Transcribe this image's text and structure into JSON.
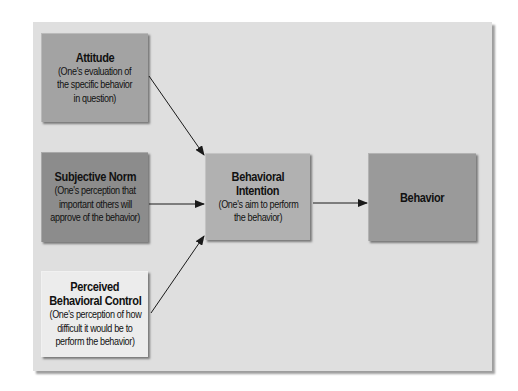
{
  "diagram": {
    "colors": {
      "panel": "#dfdfdf",
      "attitude": "#a3a3a3",
      "subjective_norm": "#8c8c8c",
      "perceived_control": "#ececec",
      "intention": "#b1b1b1",
      "behavior": "#9a9a9a",
      "arrow": "#1a1a1a"
    },
    "nodes": {
      "attitude": {
        "title": "Attitude",
        "desc": [
          "(One's evaluation of",
          "the specific behavior",
          "in question)"
        ]
      },
      "subjective_norm": {
        "title": "Subjective Norm",
        "desc": [
          "(One's perception that",
          "important others will",
          "approve of the behavior)"
        ]
      },
      "perceived_control": {
        "title_lines": [
          "Perceived",
          "Behavioral Control"
        ],
        "desc": [
          "(One's perception of how",
          "difficult it would be to",
          "perform the behavior)"
        ]
      },
      "intention": {
        "title_lines": [
          "Behavioral",
          "Intention"
        ],
        "desc": [
          "(One's aim to perform",
          "the behavior)"
        ]
      },
      "behavior": {
        "title": "Behavior"
      }
    },
    "edges": [
      {
        "from": "attitude",
        "to": "intention"
      },
      {
        "from": "subjective_norm",
        "to": "intention"
      },
      {
        "from": "perceived_control",
        "to": "intention"
      },
      {
        "from": "intention",
        "to": "behavior"
      }
    ]
  }
}
